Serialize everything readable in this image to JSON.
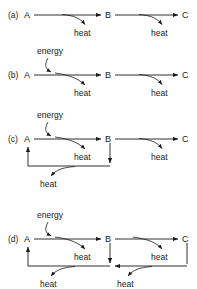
{
  "figure": {
    "title": "",
    "background_color": "#ffffff",
    "line_color": "#1a1a1a",
    "text_color": "#1a1a1a",
    "panels": [
      {
        "id": "a",
        "label": "(a)",
        "nodes": [
          "A",
          "B",
          "C"
        ],
        "energy_label": "",
        "heat_labels": [
          "heat",
          "heat"
        ],
        "feedback_heat_labels": [],
        "has_energy_input": false,
        "feedback_loops": 0
      },
      {
        "id": "b",
        "label": "(b)",
        "nodes": [
          "A",
          "B",
          "C"
        ],
        "energy_label": "energy",
        "heat_labels": [
          "heat",
          "heat"
        ],
        "feedback_heat_labels": [],
        "has_energy_input": true,
        "feedback_loops": 0
      },
      {
        "id": "c",
        "label": "(c)",
        "nodes": [
          "A",
          "B",
          "C"
        ],
        "energy_label": "energy",
        "heat_labels": [
          "heat",
          "heat"
        ],
        "feedback_heat_labels": [
          "heat"
        ],
        "has_energy_input": true,
        "feedback_loops": 1
      },
      {
        "id": "d",
        "label": "(d)",
        "nodes": [
          "A",
          "B",
          "C"
        ],
        "energy_label": "energy",
        "heat_labels": [
          "heat",
          "heat"
        ],
        "feedback_heat_labels": [
          "heat",
          "heat"
        ],
        "has_energy_input": true,
        "feedback_loops": 2
      }
    ]
  }
}
